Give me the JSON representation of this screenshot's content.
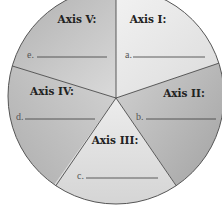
{
  "diagram": {
    "type": "pie-worksheet",
    "segments": [
      {
        "id": "I",
        "label": "Axis I:",
        "blank_letter": "a.",
        "shade": "light"
      },
      {
        "id": "II",
        "label": "Axis II:",
        "blank_letter": "b.",
        "shade": "dark"
      },
      {
        "id": "III",
        "label": "Axis III:",
        "blank_letter": "c.",
        "shade": "light"
      },
      {
        "id": "IV",
        "label": "Axis IV:",
        "blank_letter": "d.",
        "shade": "dark"
      },
      {
        "id": "V",
        "label": "Axis V:",
        "blank_letter": "e.",
        "shade": "dark"
      }
    ],
    "colors": {
      "light_start": "#f2f2f2",
      "light_end": "#d6d6d6",
      "dark_start": "#cfcfcf",
      "dark_end": "#9a9a9a",
      "divider": "#4a4a4a",
      "background": "#ffffff"
    }
  }
}
